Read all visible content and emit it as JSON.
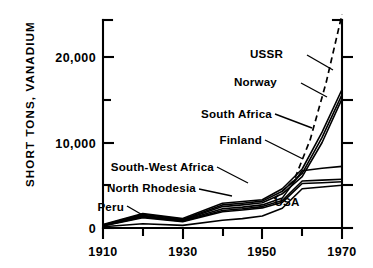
{
  "chart_data": {
    "type": "line",
    "title": "",
    "subtitle": "",
    "xlabel": "",
    "ylabel": "SHORT TONS, VANADIUM",
    "xlim": [
      1910,
      1970
    ],
    "ylim": [
      0,
      25000
    ],
    "grid": false,
    "legend_position": "inline-labels-with-leader-lines",
    "x_ticks_major": [
      1910,
      1930,
      1950,
      1970
    ],
    "x_ticks_minor": [
      1920,
      1940,
      1960
    ],
    "x_tick_labels": [
      "1910",
      "1930",
      "1950",
      "1970"
    ],
    "y_ticks_major": [
      0,
      10000,
      20000
    ],
    "y_ticks_minor": [
      5000,
      15000,
      25000
    ],
    "y_tick_labels": [
      "0",
      "10,000",
      "20,000"
    ],
    "x": [
      1910,
      1920,
      1930,
      1940,
      1945,
      1950,
      1955,
      1960,
      1965,
      1970
    ],
    "series": [
      {
        "name": "USSR",
        "style": "dashed",
        "label": "USSR",
        "x": [
          1953,
          1958,
          1962,
          1966,
          1970
        ],
        "values": [
          3400,
          5600,
          10300,
          17000,
          25000
        ]
      },
      {
        "name": "Norway",
        "style": "solid",
        "label": "Norway",
        "values": [
          400,
          1700,
          1100,
          2900,
          3100,
          3300,
          4600,
          6900,
          11200,
          16200
        ]
      },
      {
        "name": "South Africa",
        "style": "solid",
        "label": "South Africa",
        "values": [
          350,
          1600,
          1000,
          2700,
          2900,
          3150,
          4300,
          6400,
          10600,
          15600
        ]
      },
      {
        "name": "Finland",
        "style": "solid",
        "label": "Finland",
        "values": [
          320,
          1500,
          900,
          2500,
          2700,
          2950,
          4000,
          6000,
          10000,
          15100
        ]
      },
      {
        "name": "South-West Africa",
        "style": "solid",
        "label": "South-West Africa",
        "values": [
          300,
          1400,
          850,
          2250,
          2450,
          2700,
          3500,
          6700,
          7000,
          7200
        ]
      },
      {
        "name": "North Rhodesia",
        "style": "solid",
        "label": "North Rhodesia",
        "values": [
          280,
          1300,
          800,
          2050,
          2250,
          2500,
          3200,
          5500,
          5600,
          5700
        ]
      },
      {
        "name": "Peru",
        "style": "solid",
        "label": "Peru",
        "values": [
          250,
          1200,
          750,
          1900,
          2100,
          2350,
          3000,
          5200,
          5300,
          5400
        ]
      },
      {
        "name": "USA",
        "style": "solid",
        "label": "USA",
        "values": [
          150,
          500,
          300,
          900,
          1100,
          1400,
          2300,
          4600,
          4800,
          5000
        ]
      }
    ],
    "annotations": [
      {
        "text": "USSR",
        "x": 283,
        "y": 58
      },
      {
        "text": "Norway",
        "x": 268,
        "y": 86
      },
      {
        "text": "South Africa",
        "x": 213,
        "y": 118
      },
      {
        "text": "Finland",
        "x": 237,
        "y": 143
      },
      {
        "text": "South-West Africa",
        "x": 123,
        "y": 170
      },
      {
        "text": "North Rhodesia",
        "x": 113,
        "y": 192
      },
      {
        "text": "Peru",
        "x": 104,
        "y": 209
      },
      {
        "text": "USA",
        "x": 287,
        "y": 201
      }
    ]
  }
}
